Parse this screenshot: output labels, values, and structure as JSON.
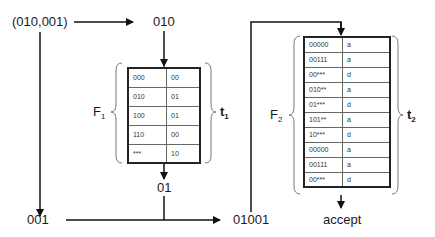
{
  "nodes": {
    "input_pair": "(010,001)",
    "first": "010",
    "second": "001",
    "f1_output": "01",
    "concat": "01001",
    "result": "accept"
  },
  "tables": {
    "f1": {
      "name": "F",
      "name_sub": "1",
      "brace_label": "t",
      "brace_sub": "1",
      "rows": [
        [
          "000",
          "00"
        ],
        [
          "010",
          "01"
        ],
        [
          "100",
          "01"
        ],
        [
          "110",
          "00"
        ],
        [
          "***",
          "10"
        ]
      ]
    },
    "f2": {
      "name": "F",
      "name_sub": "2",
      "brace_label": "t",
      "brace_sub": "2",
      "rows": [
        [
          "00000",
          "a"
        ],
        [
          "00111",
          "a"
        ],
        [
          "00***",
          "d"
        ],
        [
          "010**",
          "a"
        ],
        [
          "01***",
          "d"
        ],
        [
          "101**",
          "a"
        ],
        [
          "10***",
          "d"
        ],
        [
          "00000",
          "a"
        ],
        [
          "00111",
          "a"
        ],
        [
          "00***",
          "d"
        ]
      ]
    }
  }
}
